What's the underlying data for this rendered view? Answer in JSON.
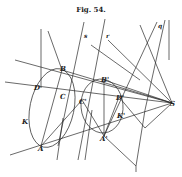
{
  "figure": {
    "title": "Fig. 54.",
    "ink_color": "#2a2a2a",
    "background": "#ffffff"
  },
  "points": [
    {
      "label": "B",
      "x": 62,
      "y": 70
    },
    {
      "label": "D",
      "x": 40,
      "y": 88
    },
    {
      "label": "C",
      "x": 66,
      "y": 97
    },
    {
      "label": "C'",
      "x": 82,
      "y": 100
    },
    {
      "label": "B'",
      "x": 104,
      "y": 80
    },
    {
      "label": "D'",
      "x": 119,
      "y": 97
    },
    {
      "label": "K'",
      "x": 118,
      "y": 113
    },
    {
      "label": "K",
      "x": 25,
      "y": 121
    },
    {
      "label": "A",
      "x": 41,
      "y": 146
    },
    {
      "label": "A'",
      "x": 104,
      "y": 136
    },
    {
      "label": "S",
      "x": 172,
      "y": 103
    }
  ],
  "line_labels": [
    {
      "label": "s",
      "x": 85,
      "y": 37
    },
    {
      "label": "r",
      "x": 107,
      "y": 37
    },
    {
      "label": "q",
      "x": 159,
      "y": 27
    }
  ]
}
